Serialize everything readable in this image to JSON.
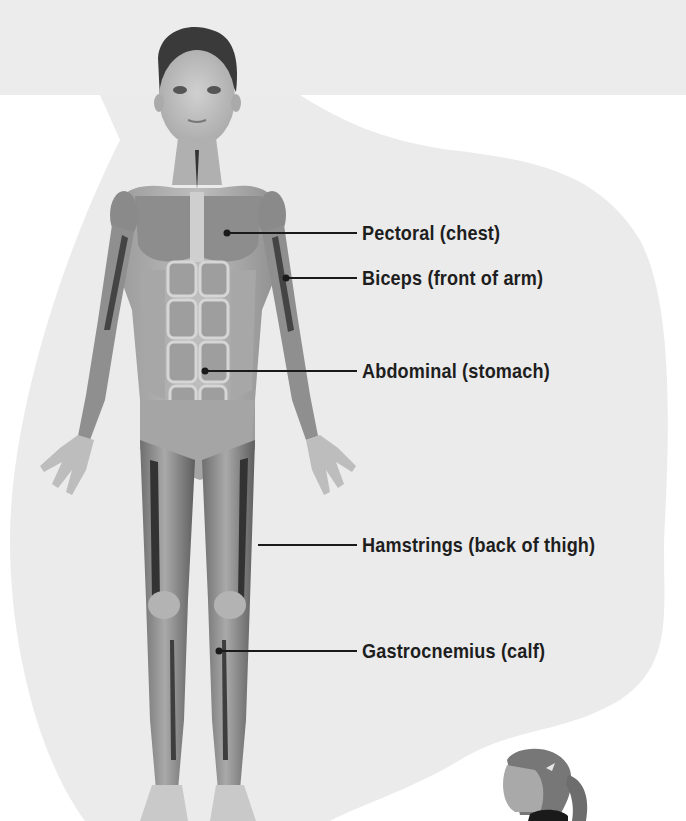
{
  "diagram": {
    "colors": {
      "top_band": "#ececec",
      "blob": "#ebebeb",
      "page": "#ffffff",
      "leader": "#1a1a1a",
      "label_text": "#1e1e1e"
    },
    "labels": [
      {
        "id": "pectoral",
        "text": "Pectoral (chest)",
        "dot": [
          227,
          233
        ],
        "line_end": [
          357,
          233
        ],
        "text_pos": [
          362,
          221
        ]
      },
      {
        "id": "biceps",
        "text": "Biceps (front of arm)",
        "dot": [
          286,
          278
        ],
        "line_end": [
          357,
          278
        ],
        "text_pos": [
          362,
          266
        ]
      },
      {
        "id": "abdominal",
        "text": "Abdominal (stomach)",
        "dot": [
          205,
          371
        ],
        "line_end": [
          357,
          371
        ],
        "text_pos": [
          362,
          359
        ]
      },
      {
        "id": "hamstrings",
        "text": "Hamstrings (back of thigh)",
        "dot": null,
        "line_start": [
          258,
          545
        ],
        "line_end": [
          357,
          545
        ],
        "text_pos": [
          362,
          533
        ]
      },
      {
        "id": "gastrocnemius",
        "text": "Gastrocnemius (calf)",
        "dot": [
          219,
          651
        ],
        "line_end": [
          357,
          651
        ],
        "text_pos": [
          362,
          639
        ]
      }
    ]
  }
}
